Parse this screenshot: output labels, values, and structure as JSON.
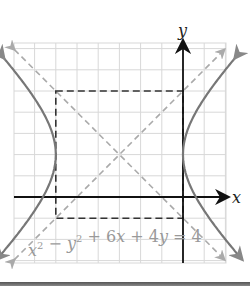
{
  "diagram": {
    "type": "hyperbola-graph",
    "equation": {
      "parts": [
        {
          "t": "x",
          "sup": "2"
        },
        {
          "t": " − "
        },
        {
          "t": "y",
          "sup": "2"
        },
        {
          "t": " + 6"
        },
        {
          "t": "x"
        },
        {
          "t": " + 4"
        },
        {
          "t": "y"
        },
        {
          "t": " = 4"
        }
      ],
      "plain": "x^2 − y^2 + 6x + 4y = 4"
    },
    "axes": {
      "x_label": "x",
      "y_label": "y",
      "x_range": [
        -8,
        2
      ],
      "y_range": [
        -3,
        7
      ]
    },
    "grid": {
      "spacing": 1,
      "color": "#d8d8d8"
    },
    "center": [
      -3,
      2
    ],
    "a": 3,
    "b": 3,
    "vertices": [
      [
        -6,
        2
      ],
      [
        0,
        2
      ]
    ],
    "rectangle": {
      "x": [
        -6,
        0
      ],
      "y": [
        -1,
        5
      ]
    },
    "asymptotes": [
      "y - 2 = (x + 3)",
      "y - 2 = -(x + 3)"
    ],
    "colors": {
      "curve": "#777777",
      "axes": "#111111",
      "asymptote": "#aaaaaa",
      "box": "#333333"
    }
  }
}
